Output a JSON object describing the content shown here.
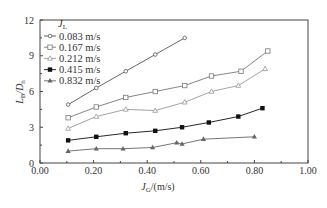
{
  "chart_data": {
    "type": "line",
    "title": "",
    "xlabel": "J_G/(m/s)",
    "xlabel_main": "J",
    "xlabel_sub": "G",
    "xlabel_unit": "/(m/s)",
    "ylabel": "L_B/D_h",
    "ylabel_main": "L",
    "ylabel_sub1": "B",
    "ylabel_mid": "/D",
    "ylabel_sub2": "h",
    "xlim": [
      0,
      1.0
    ],
    "ylim": [
      0,
      12
    ],
    "xticks": [
      "0.00",
      "0.20",
      "0.40",
      "0.60",
      "0.80",
      "1.00"
    ],
    "yticks": [
      "0",
      "3",
      "6",
      "9",
      "12"
    ],
    "grid": false,
    "legend_title_main": "J",
    "legend_title_sub": "L",
    "legend_position": "upper-left",
    "series": [
      {
        "name": "0.083 m/s",
        "marker": "open-diamond",
        "color": "#555555",
        "x": [
          0.105,
          0.21,
          0.32,
          0.43,
          0.54
        ],
        "values": [
          4.9,
          6.3,
          7.7,
          9.1,
          10.5
        ]
      },
      {
        "name": "0.167 m/s",
        "marker": "open-square",
        "color": "#777777",
        "x": [
          0.105,
          0.21,
          0.32,
          0.43,
          0.54,
          0.64,
          0.75,
          0.85
        ],
        "values": [
          3.8,
          4.7,
          5.5,
          6.0,
          6.5,
          7.3,
          7.7,
          9.4
        ]
      },
      {
        "name": "0.212 m/s",
        "marker": "open-triangle",
        "color": "#999999",
        "x": [
          0.105,
          0.21,
          0.32,
          0.43,
          0.54,
          0.64,
          0.74,
          0.84
        ],
        "values": [
          2.9,
          3.9,
          4.5,
          4.4,
          5.1,
          6.0,
          6.5,
          7.9
        ]
      },
      {
        "name": "0.415 m/s",
        "marker": "filled-square",
        "color": "#111111",
        "x": [
          0.105,
          0.21,
          0.32,
          0.43,
          0.53,
          0.63,
          0.74,
          0.83
        ],
        "values": [
          1.9,
          2.2,
          2.5,
          2.7,
          3.0,
          3.4,
          3.9,
          4.6
        ]
      },
      {
        "name": "0.832 m/s",
        "marker": "filled-star",
        "color": "#666666",
        "x": [
          0.105,
          0.21,
          0.31,
          0.42,
          0.53,
          0.51,
          0.61,
          0.8
        ],
        "values": [
          1.0,
          1.2,
          1.2,
          1.3,
          1.6,
          1.7,
          2.0,
          2.2
        ]
      }
    ]
  }
}
